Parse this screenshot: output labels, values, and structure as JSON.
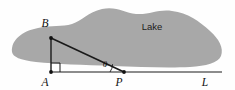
{
  "figure": {
    "background_color": "#fefefe",
    "width": 235,
    "height": 90
  },
  "lake": {
    "label": "Lake",
    "fill_color": "#a8a8a8",
    "label_x": 152,
    "label_y": 30
  },
  "points": [
    {
      "id": "B",
      "label": "B",
      "x": 51,
      "y": 38,
      "label_x": 45,
      "label_y": 27
    },
    {
      "id": "A",
      "label": "A",
      "x": 51,
      "y": 72,
      "label_x": 45,
      "label_y": 86
    },
    {
      "id": "P",
      "label": "P",
      "x": 124,
      "y": 72,
      "label_x": 119,
      "label_y": 86
    },
    {
      "id": "L",
      "label": "L",
      "x": 222,
      "y": 72,
      "label_x": 205,
      "label_y": 86
    }
  ],
  "segments": [
    {
      "id": "AL",
      "from": "A",
      "to": "L",
      "stroke": "#1a1a1a",
      "width": 1
    },
    {
      "id": "AB",
      "from": "A",
      "to": "B",
      "stroke": "#1a1a1a",
      "width": 1.4
    },
    {
      "id": "BP",
      "from": "B",
      "to": "P",
      "stroke": "#1a1a1a",
      "width": 1.6
    }
  ],
  "angles": [
    {
      "id": "right-angle-at-A",
      "at": "A",
      "type": "right-angle",
      "marker_size": 9
    },
    {
      "id": "theta-at-P",
      "at": "P",
      "type": "arc",
      "label": "θ",
      "label_x": 105,
      "label_y": 67
    }
  ],
  "colors": {
    "ink": "#1a1a1a",
    "lake_gray": "#a8a8a8",
    "paper": "#fefefe"
  }
}
